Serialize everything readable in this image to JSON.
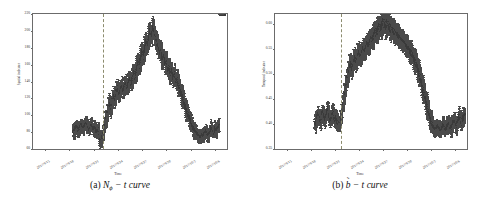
{
  "figure": {
    "panels": [
      {
        "id": "panel-a",
        "caption_prefix": "(a)",
        "caption_symbol": "N",
        "caption_sub": "ϕ",
        "caption_rest": "− t curve",
        "caption_full": "(a) 𝒩ϕ − t curve"
      },
      {
        "id": "panel-b",
        "caption_prefix": "(b)",
        "caption_symbol": "b",
        "caption_tilde": "˜",
        "caption_rest": "− t curve",
        "caption_full": "(b) b̃ − t curve"
      }
    ]
  },
  "chart_data": [
    {
      "type": "scatter",
      "panel": "a",
      "title": "",
      "xlabel": "Time",
      "ylabel": "Spatial indicator",
      "ylim": [
        60,
        220
      ],
      "yticks": [
        60,
        80,
        100,
        120,
        140,
        160,
        180,
        200,
        220
      ],
      "ytick_labels": [
        "60",
        "80",
        "100",
        "120",
        "140",
        "160",
        "180",
        "200",
        "220"
      ],
      "xtick_labels": [
        "2017/9/15",
        "2017/9/18",
        "2017/9/21",
        "2017/9/24",
        "2017/9/27",
        "2017/9/30",
        "2017/10/3",
        "2017/10/6"
      ],
      "grid": false,
      "legend": null,
      "errorbars": true,
      "marker": "point-with-vertical-errorbar",
      "marker_color": "#3a3a3a",
      "annotations": [
        {
          "type": "vline",
          "style": "dashed",
          "color": "#8c8c6e",
          "x_label": "2017/9/24",
          "x_frac": 0.362
        }
      ],
      "data_start_frac": 0.205,
      "series": [
        {
          "name": "N_phi",
          "x_frac": [
            0.205,
            0.212,
            0.219,
            0.226,
            0.233,
            0.24,
            0.247,
            0.254,
            0.261,
            0.268,
            0.275,
            0.282,
            0.289,
            0.296,
            0.303,
            0.31,
            0.317,
            0.324,
            0.331,
            0.338,
            0.345,
            0.352,
            0.359,
            0.366,
            0.373,
            0.38,
            0.387,
            0.394,
            0.401,
            0.408,
            0.415,
            0.422,
            0.429,
            0.436,
            0.443,
            0.45,
            0.457,
            0.464,
            0.471,
            0.478,
            0.485,
            0.492,
            0.499,
            0.506,
            0.513,
            0.52,
            0.527,
            0.534,
            0.541,
            0.548,
            0.555,
            0.562,
            0.569,
            0.576,
            0.583,
            0.59,
            0.597,
            0.604,
            0.611,
            0.618,
            0.625,
            0.632,
            0.639,
            0.646,
            0.653,
            0.66,
            0.667,
            0.674,
            0.681,
            0.688,
            0.695,
            0.702,
            0.709,
            0.716,
            0.723,
            0.73,
            0.737,
            0.744,
            0.751,
            0.758,
            0.765,
            0.772,
            0.779,
            0.786,
            0.793,
            0.8,
            0.807,
            0.814,
            0.821,
            0.828,
            0.835,
            0.842,
            0.849,
            0.856,
            0.863,
            0.87,
            0.877,
            0.884,
            0.891,
            0.898,
            0.905,
            0.912,
            0.919,
            0.926,
            0.933,
            0.94,
            0.947,
            0.954,
            0.961,
            0.968,
            0.975,
            0.982
          ],
          "values": [
            80,
            78,
            82,
            84,
            79,
            81,
            86,
            83,
            80,
            85,
            88,
            82,
            79,
            84,
            86,
            81,
            83,
            80,
            78,
            82,
            68,
            72,
            75,
            85,
            95,
            102,
            110,
            118,
            112,
            120,
            128,
            124,
            132,
            138,
            130,
            136,
            142,
            134,
            140,
            146,
            138,
            144,
            150,
            142,
            148,
            156,
            150,
            158,
            165,
            160,
            168,
            175,
            170,
            178,
            185,
            180,
            190,
            196,
            188,
            200,
            192,
            186,
            180,
            175,
            168,
            172,
            160,
            165,
            155,
            158,
            148,
            152,
            145,
            150,
            142,
            146,
            138,
            142,
            134,
            130,
            126,
            122,
            118,
            112,
            108,
            104,
            100,
            96,
            92,
            88,
            86,
            84,
            82,
            80,
            78,
            82,
            80,
            84,
            86,
            82,
            80,
            84,
            88,
            86,
            82,
            86,
            84,
            88,
            86,
            90,
            88,
            92
          ],
          "errors": [
            6,
            6,
            6,
            6,
            6,
            6,
            6,
            6,
            6,
            6,
            6,
            6,
            6,
            6,
            6,
            6,
            6,
            6,
            6,
            6,
            7,
            7,
            7,
            7,
            8,
            8,
            8,
            8,
            8,
            8,
            8,
            8,
            8,
            8,
            8,
            8,
            8,
            8,
            8,
            8,
            8,
            8,
            8,
            8,
            8,
            9,
            9,
            9,
            9,
            9,
            9,
            9,
            9,
            9,
            9,
            9,
            9,
            9,
            9,
            9,
            9,
            9,
            9,
            9,
            9,
            9,
            9,
            9,
            9,
            9,
            9,
            9,
            8,
            8,
            8,
            8,
            8,
            8,
            8,
            8,
            8,
            8,
            8,
            8,
            7,
            7,
            7,
            7,
            7,
            7,
            6,
            6,
            6,
            6,
            6,
            6,
            6,
            6,
            6,
            6,
            6,
            6,
            6,
            6,
            6,
            6,
            6,
            6
          ]
        }
      ]
    },
    {
      "type": "scatter",
      "panel": "b",
      "title": "",
      "xlabel": "Time",
      "ylabel": "Temporal indicator",
      "ylim": [
        0.35,
        0.62
      ],
      "yticks": [
        0.35,
        0.4,
        0.45,
        0.5,
        0.55,
        0.6
      ],
      "ytick_labels": [
        "0.35",
        "0.40",
        "0.45",
        "0.50",
        "0.55",
        "0.60"
      ],
      "xtick_labels": [
        "2017/9/15",
        "2017/9/18",
        "2017/9/21",
        "2017/9/24",
        "2017/9/27",
        "2017/9/30",
        "2017/10/3",
        "2017/10/6"
      ],
      "grid": false,
      "legend": null,
      "errorbars": true,
      "marker": "point-with-vertical-errorbar",
      "marker_color": "#3a3a3a",
      "annotations": [
        {
          "type": "vline",
          "style": "dashed",
          "color": "#8c8c6e",
          "x_label": "2017/9/24",
          "x_frac": 0.345
        }
      ],
      "data_start_frac": 0.205,
      "series": [
        {
          "name": "b_tilde",
          "x_frac": [
            0.205,
            0.212,
            0.219,
            0.226,
            0.233,
            0.24,
            0.247,
            0.254,
            0.261,
            0.268,
            0.275,
            0.282,
            0.289,
            0.296,
            0.303,
            0.31,
            0.317,
            0.324,
            0.331,
            0.338,
            0.345,
            0.352,
            0.359,
            0.366,
            0.373,
            0.38,
            0.387,
            0.394,
            0.401,
            0.408,
            0.415,
            0.422,
            0.429,
            0.436,
            0.443,
            0.45,
            0.457,
            0.464,
            0.471,
            0.478,
            0.485,
            0.492,
            0.499,
            0.506,
            0.513,
            0.52,
            0.527,
            0.534,
            0.541,
            0.548,
            0.555,
            0.562,
            0.569,
            0.576,
            0.583,
            0.59,
            0.597,
            0.604,
            0.611,
            0.618,
            0.625,
            0.632,
            0.639,
            0.646,
            0.653,
            0.66,
            0.667,
            0.674,
            0.681,
            0.688,
            0.695,
            0.702,
            0.709,
            0.716,
            0.723,
            0.73,
            0.737,
            0.744,
            0.751,
            0.758,
            0.765,
            0.772,
            0.779,
            0.786,
            0.793,
            0.8,
            0.807,
            0.814,
            0.821,
            0.828,
            0.835,
            0.842,
            0.849,
            0.856,
            0.863,
            0.87,
            0.877,
            0.884,
            0.891,
            0.898,
            0.905,
            0.912,
            0.919,
            0.926,
            0.933,
            0.94,
            0.947,
            0.954,
            0.961,
            0.968,
            0.975,
            0.982
          ],
          "values": [
            0.4,
            0.395,
            0.41,
            0.415,
            0.402,
            0.398,
            0.42,
            0.408,
            0.4,
            0.412,
            0.425,
            0.405,
            0.398,
            0.41,
            0.418,
            0.402,
            0.408,
            0.4,
            0.395,
            0.405,
            0.412,
            0.43,
            0.455,
            0.47,
            0.49,
            0.505,
            0.515,
            0.525,
            0.52,
            0.53,
            0.54,
            0.535,
            0.545,
            0.555,
            0.548,
            0.552,
            0.565,
            0.558,
            0.562,
            0.575,
            0.568,
            0.572,
            0.585,
            0.578,
            0.582,
            0.595,
            0.588,
            0.592,
            0.6,
            0.595,
            0.598,
            0.605,
            0.6,
            0.595,
            0.598,
            0.592,
            0.588,
            0.585,
            0.58,
            0.578,
            0.575,
            0.572,
            0.568,
            0.565,
            0.562,
            0.558,
            0.555,
            0.552,
            0.548,
            0.545,
            0.542,
            0.538,
            0.535,
            0.53,
            0.525,
            0.52,
            0.515,
            0.508,
            0.5,
            0.49,
            0.48,
            0.47,
            0.46,
            0.45,
            0.44,
            0.43,
            0.42,
            0.412,
            0.405,
            0.4,
            0.398,
            0.402,
            0.405,
            0.4,
            0.395,
            0.402,
            0.408,
            0.4,
            0.398,
            0.405,
            0.41,
            0.402,
            0.398,
            0.408,
            0.412,
            0.405,
            0.4,
            0.41,
            0.415,
            0.408,
            0.402,
            0.412
          ],
          "errors": [
            0.012,
            0.012,
            0.012,
            0.012,
            0.012,
            0.012,
            0.012,
            0.012,
            0.012,
            0.012,
            0.012,
            0.012,
            0.012,
            0.012,
            0.012,
            0.012,
            0.012,
            0.012,
            0.012,
            0.012,
            0.014,
            0.016,
            0.016,
            0.016,
            0.016,
            0.016,
            0.016,
            0.016,
            0.016,
            0.016,
            0.016,
            0.016,
            0.016,
            0.016,
            0.016,
            0.016,
            0.016,
            0.016,
            0.016,
            0.016,
            0.016,
            0.016,
            0.016,
            0.016,
            0.016,
            0.016,
            0.016,
            0.016,
            0.016,
            0.016,
            0.016,
            0.016,
            0.016,
            0.016,
            0.016,
            0.016,
            0.016,
            0.016,
            0.016,
            0.016,
            0.016,
            0.016,
            0.016,
            0.016,
            0.016,
            0.016,
            0.016,
            0.016,
            0.016,
            0.016,
            0.016,
            0.016,
            0.016,
            0.016,
            0.016,
            0.016,
            0.016,
            0.016,
            0.016,
            0.016,
            0.016,
            0.016,
            0.016,
            0.016,
            0.016,
            0.016,
            0.014,
            0.014,
            0.012,
            0.012,
            0.012,
            0.012,
            0.012,
            0.012,
            0.012,
            0.012,
            0.012,
            0.012,
            0.012,
            0.012,
            0.012,
            0.012,
            0.012,
            0.012,
            0.012,
            0.012,
            0.012,
            0.012,
            0.012,
            0.012,
            0.012,
            0.012
          ]
        }
      ]
    }
  ]
}
